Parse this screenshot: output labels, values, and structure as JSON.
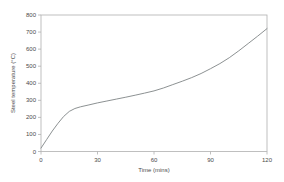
{
  "figure": {
    "background": "#ffffff",
    "frame_color": "#b0b0b0",
    "line_color": "#7f8486",
    "text_color": "#4a4a4a"
  },
  "chart_data": {
    "type": "line",
    "title": "",
    "xlabel": "Time (mins)",
    "ylabel": "Steel temperature (°C)",
    "xlim": [
      0,
      120
    ],
    "ylim": [
      0,
      800
    ],
    "xticks": [
      0,
      30,
      60,
      90,
      120
    ],
    "yticks": [
      0,
      100,
      200,
      300,
      400,
      500,
      600,
      700,
      800
    ],
    "grid": false,
    "legend": false,
    "series": [
      {
        "name": "Steel temperature",
        "x": [
          0,
          3,
          6,
          9,
          12,
          15,
          18,
          21,
          25,
          30,
          35,
          40,
          45,
          50,
          55,
          60,
          65,
          70,
          75,
          80,
          85,
          90,
          95,
          100,
          105,
          110,
          115,
          120
        ],
        "y": [
          20,
          70,
          120,
          165,
          205,
          235,
          252,
          262,
          272,
          285,
          296,
          307,
          318,
          330,
          342,
          355,
          372,
          392,
          412,
          433,
          457,
          485,
          515,
          550,
          590,
          633,
          676,
          720
        ]
      }
    ]
  }
}
